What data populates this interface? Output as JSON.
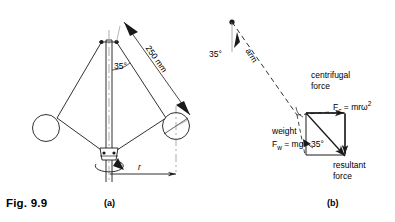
{
  "figure": {
    "caption": "Fig. 9.9",
    "panel_a_label": "(a)",
    "panel_b_label": "(b)"
  },
  "panel_a": {
    "angle_label": "35°",
    "dimension_label": "250 mm",
    "radius_label": "r"
  },
  "panel_b": {
    "angle_label": "35°",
    "arm_label": "arm",
    "centrifugal_line1": "centrifugal",
    "centrifugal_line2": "force",
    "fc_symbol": "F",
    "fc_subscript": "c",
    "fc_equals": " = mr",
    "fc_omega": "ω",
    "fc_power": "2",
    "weight_line1": "weight",
    "fw_symbol": "F",
    "fw_subscript": "w",
    "fw_equals": " = mg",
    "triangle_angle": "35°",
    "resultant_line1": "resultant",
    "resultant_line2": "force"
  },
  "colors": {
    "stroke": "#1a1a1a",
    "background": "#ffffff",
    "text": "#000000"
  }
}
